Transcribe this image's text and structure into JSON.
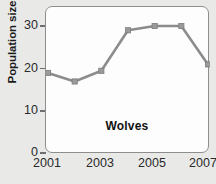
{
  "chart_data": {
    "type": "line",
    "title": "",
    "subtitle": "",
    "series_label": "Wolves",
    "xlabel": "",
    "ylabel": "Population size",
    "x": [
      2001,
      2002,
      2003,
      2004,
      2005,
      2006,
      2007
    ],
    "values": [
      19,
      17,
      19.5,
      29,
      30,
      30,
      21
    ],
    "series": [
      {
        "name": "Wolves",
        "values": [
          19,
          17,
          19.5,
          29,
          30,
          30,
          21
        ]
      }
    ],
    "xlim": [
      2001,
      2007
    ],
    "ylim": [
      0,
      35
    ],
    "x_tick_labels": [
      "2001",
      "2003",
      "2005",
      "2007"
    ],
    "x_tick_values": [
      2001,
      2003,
      2005,
      2007
    ],
    "y_tick_labels": [
      "0",
      "10",
      "20",
      "30"
    ],
    "y_tick_values": [
      0,
      10,
      20,
      30
    ],
    "grid": false,
    "legend": "none",
    "marker": "square",
    "line_color": "#8c8c8c",
    "marker_color": "#9a9a9a",
    "plot_background": "#fdfdfd",
    "figure_background": "#e9e9e8",
    "axis_color": "#8e8e8e",
    "text_color": "#1b1b1b"
  }
}
